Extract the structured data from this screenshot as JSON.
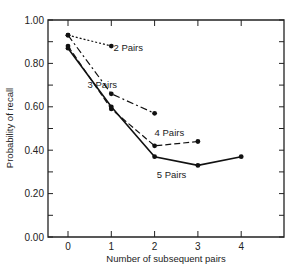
{
  "chart_data": {
    "type": "line",
    "title": "",
    "xlabel": "Number of subsequent pairs",
    "ylabel": "Probability of recall",
    "x_ticks": [
      "0",
      "1",
      "2",
      "3",
      "4"
    ],
    "y_ticks": [
      "0.00",
      "0.20",
      "0.40",
      "0.60",
      "0.80",
      "1.00"
    ],
    "xlim": [
      -0.45,
      5
    ],
    "ylim": [
      0,
      1.0
    ],
    "grid": false,
    "legend": "inline labels",
    "series": [
      {
        "name": "2 Pairs",
        "x": [
          0,
          1
        ],
        "values": [
          0.93,
          0.88
        ],
        "dash": "2,2",
        "label_pos": [
          1.05,
          0.855
        ]
      },
      {
        "name": "3 Pairs",
        "x": [
          0,
          1,
          2
        ],
        "values": [
          0.93,
          0.66,
          0.57
        ],
        "dash": "7,3,2,3",
        "label_pos": [
          0.45,
          0.685
        ]
      },
      {
        "name": "4 Pairs",
        "x": [
          0,
          1,
          2,
          3
        ],
        "values": [
          0.88,
          0.59,
          0.42,
          0.44
        ],
        "dash": "6,3",
        "label_pos": [
          2.0,
          0.465
        ]
      },
      {
        "name": "5 Pairs",
        "x": [
          0,
          1,
          2,
          3,
          4
        ],
        "values": [
          0.87,
          0.6,
          0.37,
          0.33,
          0.37
        ],
        "dash": "",
        "label_pos": [
          2.05,
          0.27
        ]
      }
    ]
  }
}
